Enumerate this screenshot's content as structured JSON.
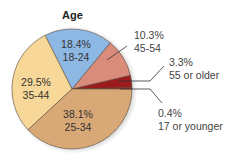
{
  "chart_data": {
    "type": "pie",
    "title": "Age",
    "slices": [
      {
        "label": "17 or younger",
        "value": 0.4,
        "display": "0.4%",
        "color": "#c3201f",
        "placement": "outside"
      },
      {
        "label": "55 or older",
        "value": 3.3,
        "display": "3.3%",
        "color": "#9b1c1a",
        "placement": "outside"
      },
      {
        "label": "45-54",
        "value": 10.3,
        "display": "10.3%",
        "color": "#d98c7a",
        "placement": "outside"
      },
      {
        "label": "18-24",
        "value": 18.4,
        "display": "18.4%",
        "color": "#8db8e4",
        "placement": "inside"
      },
      {
        "label": "35-44",
        "value": 29.5,
        "display": "29.5%",
        "color": "#f7d898",
        "placement": "inside"
      },
      {
        "label": "25-34",
        "value": 38.1,
        "display": "38.1%",
        "color": "#d9a877",
        "placement": "inside"
      }
    ],
    "start_angle_deg": 0,
    "direction": "counterclockwise",
    "legend": "none"
  },
  "labels": {
    "title": "Age",
    "s18_24_pct": "18.4%",
    "s18_24_name": "18-24",
    "s35_44_pct": "29.5%",
    "s35_44_name": "35-44",
    "s25_34_pct": "38.1%",
    "s25_34_name": "25-34",
    "s45_54_pct": "10.3%",
    "s45_54_name": "45-54",
    "s55_pct": "3.3%",
    "s55_name": "55 or older",
    "s17_pct": "0.4%",
    "s17_name": "17 or younger"
  }
}
